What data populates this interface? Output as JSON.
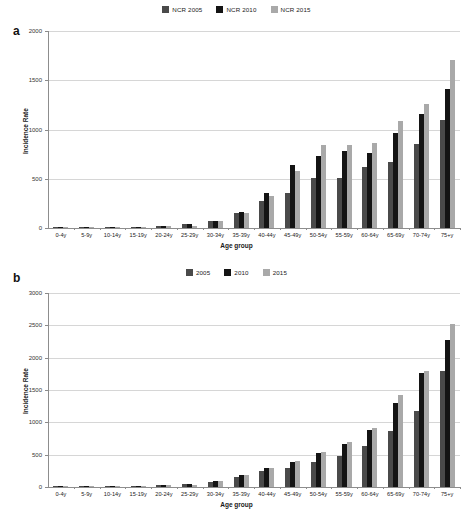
{
  "figure": {
    "panels": [
      {
        "letter": "a",
        "legend": [
          {
            "label": "NCR 2005",
            "color": "#4a4a4a"
          },
          {
            "label": "NCR 2010",
            "color": "#141414"
          },
          {
            "label": "NCR 2015",
            "color": "#a9a9a9"
          }
        ]
      },
      {
        "letter": "b",
        "legend": [
          {
            "label": "2005",
            "color": "#4a4a4a"
          },
          {
            "label": "2010",
            "color": "#141414"
          },
          {
            "label": "2015",
            "color": "#a9a9a9"
          }
        ]
      }
    ]
  },
  "chart_data": [
    {
      "type": "bar",
      "panel": "a",
      "title": "",
      "xlabel": "Age group",
      "ylabel": "Incidence Rate",
      "ylim": [
        0,
        2000
      ],
      "yticks": [
        0,
        500,
        1000,
        1500,
        2000
      ],
      "grid": true,
      "legend_position": "top-center",
      "categories": [
        "0-4y",
        "5-9y",
        "10-14y",
        "15-19y",
        "20-24y",
        "25-29y",
        "30-34y",
        "35-39y",
        "40-44y",
        "45-49y",
        "50-54y",
        "55-59y",
        "60-64y",
        "65-69y",
        "70-74y",
        "75+y"
      ],
      "series": [
        {
          "name": "NCR 2005",
          "color": "#4a4a4a",
          "values": [
            14,
            8,
            6,
            10,
            22,
            36,
            68,
            152,
            274,
            352,
            510,
            512,
            620,
            668,
            852,
            1094
          ]
        },
        {
          "name": "NCR 2010",
          "color": "#141414",
          "values": [
            8,
            7,
            7,
            10,
            21,
            40,
            76,
            160,
            360,
            640,
            728,
            784,
            760,
            962,
            1154,
            1416
          ]
        },
        {
          "name": "NCR 2015",
          "color": "#a9a9a9",
          "values": [
            4,
            6,
            8,
            14,
            20,
            24,
            72,
            152,
            326,
            580,
            838,
            838,
            862,
            1086,
            1258,
            1706
          ]
        }
      ]
    },
    {
      "type": "bar",
      "panel": "b",
      "title": "",
      "xlabel": "Age group",
      "ylabel": "Incidence Rate",
      "ylim": [
        0,
        3000
      ],
      "yticks": [
        0,
        500,
        1000,
        1500,
        2000,
        2500,
        3000
      ],
      "grid": true,
      "legend_position": "top-center",
      "categories": [
        "0-4y",
        "5-9y",
        "10-14y",
        "15-19y",
        "20-24y",
        "25-29y",
        "30-34y",
        "35-39y",
        "40-44y",
        "45-49y",
        "50-54y",
        "55-59y",
        "60-64y",
        "65-69y",
        "70-74y",
        "75+y"
      ],
      "series": [
        {
          "name": "2005",
          "color": "#4a4a4a",
          "values": [
            18,
            10,
            8,
            12,
            26,
            44,
            84,
            150,
            240,
            300,
            390,
            480,
            640,
            860,
            1180,
            1800
          ]
        },
        {
          "name": "2010",
          "color": "#141414",
          "values": [
            12,
            9,
            9,
            13,
            28,
            50,
            96,
            180,
            300,
            390,
            520,
            660,
            880,
            1300,
            1760,
            2280
          ]
        },
        {
          "name": "2015",
          "color": "#a9a9a9",
          "values": [
            8,
            8,
            10,
            16,
            26,
            36,
            92,
            180,
            300,
            400,
            540,
            690,
            910,
            1420,
            1800,
            2520
          ]
        }
      ]
    }
  ]
}
